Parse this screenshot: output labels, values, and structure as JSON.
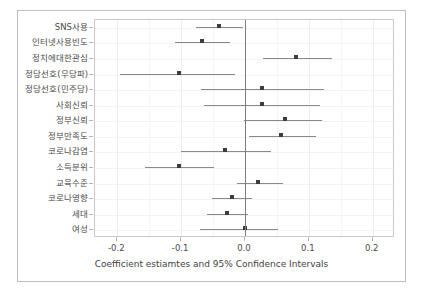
{
  "figure": {
    "background": "#ffffff",
    "point_color": "#3d3d3d",
    "ci_color": "#8a8a8a",
    "grid_color": "#ededed",
    "zero_line_color": "#7d7d7d",
    "axis_title": "Coefficient estiamtes and 95% Confidence Intervals"
  },
  "chart_data": {
    "type": "scatter",
    "subtype": "forest-plot",
    "title": "",
    "xlabel": "Coefficient estiamtes and 95% Confidence Intervals",
    "ylabel": "",
    "xlim": [
      -0.235,
      0.235
    ],
    "xticks": [
      -0.2,
      -0.1,
      0.0,
      0.1,
      0.2
    ],
    "xticklabels": [
      "-0.2",
      "-0.1",
      "0.0",
      "0.1",
      "0.2"
    ],
    "grid": true,
    "legend": "none",
    "reference_line": 0.0,
    "categories": [
      "SNS사용",
      "인터넷사용빈도",
      "정치에대한관심",
      "정당선호(무당파)",
      "정당선호(민주당)",
      "사회신뢰",
      "정부신뢰",
      "정부만족도",
      "코로나감염",
      "소득분위",
      "교육수준",
      "코로나영향",
      "세대",
      "여성"
    ],
    "estimates": [
      -0.04,
      -0.068,
      0.08,
      -0.104,
      0.027,
      0.027,
      0.063,
      0.057,
      -0.032,
      -0.103,
      0.021,
      -0.021,
      -0.028,
      0.0
    ],
    "ci_lower": [
      -0.076,
      -0.109,
      0.028,
      -0.196,
      -0.069,
      -0.064,
      -0.001,
      0.007,
      -0.1,
      -0.156,
      -0.013,
      -0.052,
      -0.06,
      -0.071
    ],
    "ci_upper": [
      -0.003,
      -0.024,
      0.136,
      -0.016,
      0.123,
      0.117,
      0.121,
      0.111,
      0.04,
      -0.049,
      0.059,
      0.011,
      0.004,
      0.051
    ]
  }
}
